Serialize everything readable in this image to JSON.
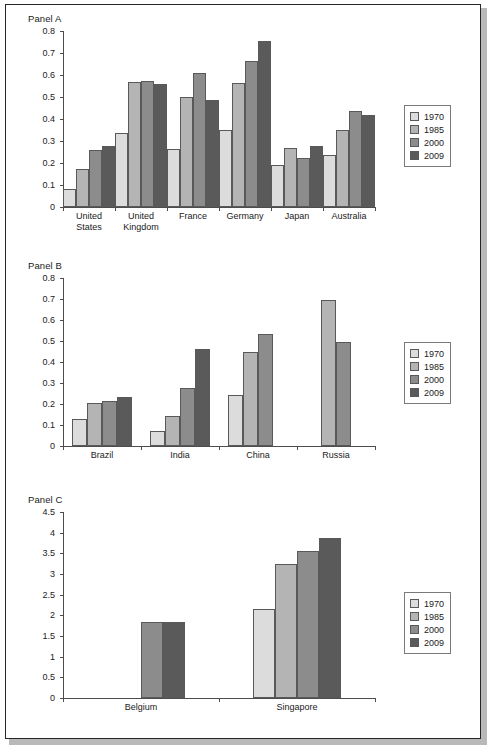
{
  "figure": {
    "background": "#ffffff",
    "border_color": "#262626"
  },
  "series_colors": {
    "1970": "#dcdcdc",
    "1985": "#b4b4b4",
    "2000": "#8c8c8c",
    "2009": "#5a5a5a"
  },
  "legend": {
    "items": [
      {
        "label": "1970",
        "color": "#dcdcdc"
      },
      {
        "label": "1985",
        "color": "#b4b4b4"
      },
      {
        "label": "2000",
        "color": "#8c8c8c"
      },
      {
        "label": "2009",
        "color": "#5a5a5a"
      }
    ]
  },
  "panels": [
    {
      "title": "Panel A"
    },
    {
      "title": "Panel B"
    },
    {
      "title": "Panel C"
    }
  ],
  "chart_data": [
    {
      "type": "bar",
      "title": "Panel A",
      "xlabel": "",
      "ylabel": "",
      "ylim": [
        0,
        0.8
      ],
      "yticks": [
        "0",
        "0.1",
        "0.2",
        "0.3",
        "0.4",
        "0.5",
        "0.6",
        "0.7",
        "0.8"
      ],
      "ytick_values": [
        0,
        0.1,
        0.2,
        0.3,
        0.4,
        0.5,
        0.6,
        0.7,
        0.8
      ],
      "grid": false,
      "legend_position": "right",
      "categories": [
        "United States",
        "United Kingdom",
        "France",
        "Germany",
        "Japan",
        "Australia"
      ],
      "series": [
        {
          "name": "1970",
          "values": [
            0.082,
            0.335,
            0.262,
            0.348,
            0.19,
            0.236
          ]
        },
        {
          "name": "1985",
          "values": [
            0.172,
            0.568,
            0.502,
            0.565,
            0.27,
            0.348
          ]
        },
        {
          "name": "2000",
          "values": [
            0.26,
            0.573,
            0.61,
            0.665,
            0.224,
            0.438
          ]
        },
        {
          "name": "2009",
          "values": [
            0.276,
            0.561,
            0.485,
            0.755,
            0.277,
            0.42
          ]
        }
      ]
    },
    {
      "type": "bar",
      "title": "Panel B",
      "xlabel": "",
      "ylabel": "",
      "ylim": [
        0,
        0.8
      ],
      "yticks": [
        "0",
        "0.1",
        "0.2",
        "0.3",
        "0.4",
        "0.5",
        "0.6",
        "0.7",
        "0.8"
      ],
      "ytick_values": [
        0,
        0.1,
        0.2,
        0.3,
        0.4,
        0.5,
        0.6,
        0.7,
        0.8
      ],
      "grid": false,
      "legend_position": "right",
      "categories": [
        "Brazil",
        "India",
        "China",
        "Russia"
      ],
      "series": [
        {
          "name": "1970",
          "values": [
            0.129,
            0.072,
            0.245,
            null
          ]
        },
        {
          "name": "1985",
          "values": [
            0.203,
            0.142,
            0.45,
            0.695
          ]
        },
        {
          "name": "2000",
          "values": [
            0.215,
            0.276,
            0.531,
            0.497
          ]
        },
        {
          "name": "2009",
          "values": [
            0.233,
            0.464,
            null,
            null
          ]
        }
      ]
    },
    {
      "type": "bar",
      "title": "Panel C",
      "xlabel": "",
      "ylabel": "",
      "ylim": [
        0,
        4.5
      ],
      "yticks": [
        "0",
        "0.5",
        "1",
        "1.5",
        "2",
        "2.5",
        "3",
        "3.5",
        "4",
        "4.5"
      ],
      "ytick_values": [
        0,
        0.5,
        1,
        1.5,
        2,
        2.5,
        3,
        3.5,
        4,
        4.5
      ],
      "grid": false,
      "legend_position": "right",
      "categories": [
        "Belgium",
        "Singapore"
      ],
      "series": [
        {
          "name": "1970",
          "values": [
            null,
            2.15
          ]
        },
        {
          "name": "1985",
          "values": [
            null,
            3.24
          ]
        },
        {
          "name": "2000",
          "values": [
            1.85,
            3.56
          ]
        },
        {
          "name": "2009",
          "values": [
            1.85,
            3.87
          ]
        }
      ]
    }
  ]
}
